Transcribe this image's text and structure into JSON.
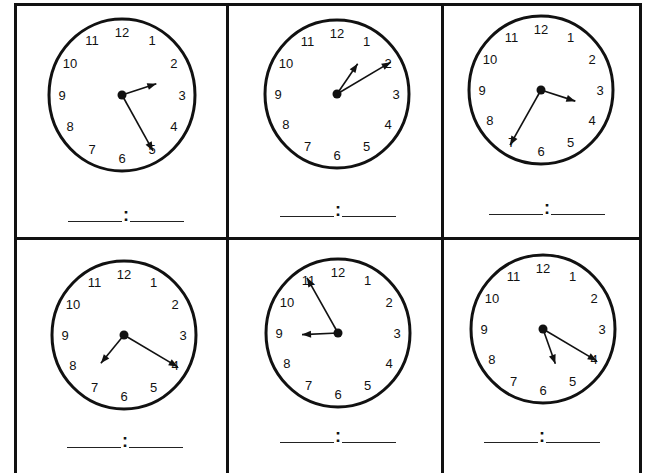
{
  "worksheet": {
    "colon": ":",
    "clocks": [
      {
        "id": 1,
        "hour": 2,
        "minute": 25,
        "hour_label": "2",
        "minute_label": "25"
      },
      {
        "id": 2,
        "hour": 1,
        "minute": 10,
        "hour_label": "1",
        "minute_label": "10"
      },
      {
        "id": 3,
        "hour": 3,
        "minute": 35,
        "hour_label": "3",
        "minute_label": "35"
      },
      {
        "id": 4,
        "hour": 7,
        "minute": 20,
        "hour_label": "7",
        "minute_label": "20"
      },
      {
        "id": 5,
        "hour": 8,
        "minute": 55,
        "hour_label": "8",
        "minute_label": "55"
      },
      {
        "id": 6,
        "hour": 5,
        "minute": 20,
        "hour_label": "5",
        "minute_label": "20"
      }
    ],
    "numerals": [
      "12",
      "1",
      "2",
      "3",
      "4",
      "5",
      "6",
      "7",
      "8",
      "9",
      "10",
      "11"
    ]
  }
}
